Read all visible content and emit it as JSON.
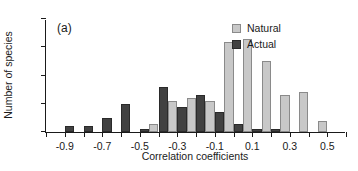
{
  "panel": {
    "tag": "(a)"
  },
  "legend": {
    "position": "top-right",
    "entries": [
      {
        "label": "Natural",
        "color": "#c8c8c8",
        "key": "natural"
      },
      {
        "label": "Actual",
        "color": "#414141",
        "key": "actual"
      }
    ]
  },
  "axes": {
    "y": {
      "label": "Number of species",
      "ticks": [
        0,
        10,
        20,
        30,
        40
      ],
      "tick_labels": [
        "0",
        "10",
        "20",
        "30",
        "40"
      ],
      "min": 0,
      "max": 40
    },
    "x": {
      "label": "Correlation coefficients",
      "min": -1.0,
      "max": 0.6,
      "minor_tick_step": 0.1,
      "ticks": [
        -0.9,
        -0.7,
        -0.5,
        -0.3,
        -0.1,
        0.1,
        0.3,
        0.5
      ],
      "tick_labels": [
        "-0.9",
        "-0.7",
        "-0.5",
        "-0.3",
        "-0.1",
        "0.1",
        "0.3",
        "0.5"
      ]
    }
  },
  "chart_data": {
    "type": "bar",
    "title": "",
    "subtitle": "",
    "xlabel": "Correlation coefficients",
    "ylabel": "Number of species",
    "xlim": [
      -1.0,
      0.6
    ],
    "ylim": [
      0,
      40
    ],
    "grid": false,
    "legend_position": "top-right",
    "annotations": [
      "(a)"
    ],
    "bin_width": 0.1,
    "categories": [
      "-1.0",
      "-0.9",
      "-0.8",
      "-0.7",
      "-0.6",
      "-0.5",
      "-0.4",
      "-0.3",
      "-0.2",
      "-0.1",
      "0.0",
      "0.1",
      "0.2",
      "0.3",
      "0.4",
      "0.5"
    ],
    "bin_centers": [
      -0.95,
      -0.85,
      -0.75,
      -0.65,
      -0.55,
      -0.45,
      -0.35,
      -0.25,
      -0.15,
      -0.05,
      0.05,
      0.15,
      0.25,
      0.35,
      0.45,
      0.55
    ],
    "series": [
      {
        "name": "Actual",
        "color": "#414141",
        "values": [
          0,
          2,
          2,
          5,
          10,
          1,
          16,
          9,
          13,
          7,
          3,
          1,
          1,
          0,
          0,
          0
        ]
      },
      {
        "name": "Natural",
        "color": "#c8c8c8",
        "values": [
          0,
          0,
          0,
          0,
          0,
          3,
          11,
          12,
          11,
          32,
          33,
          25,
          13,
          14,
          4,
          0
        ]
      }
    ]
  }
}
